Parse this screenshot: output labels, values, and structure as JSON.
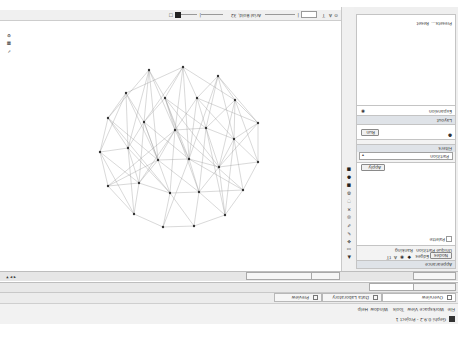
{
  "window": {
    "title": "Gephi 0.9.2 - Project 1"
  },
  "menu": [
    "File",
    "Workspace",
    "View",
    "Tools",
    "Window",
    "Help"
  ],
  "perspectives": [
    {
      "label": "Overview",
      "icon": "overview-icon",
      "active": true
    },
    {
      "label": "Data Laboratory",
      "icon": "table-icon",
      "active": false
    },
    {
      "label": "Preview",
      "icon": "preview-icon",
      "active": false
    }
  ],
  "workspaces": [
    {
      "label": "Workspace 1",
      "close": "×"
    },
    {
      "label": "Workspace 2",
      "close": "×"
    }
  ],
  "doc_tabs": [
    {
      "label": "Appearance",
      "close": "×"
    },
    {
      "label": "Graph",
      "close": "×"
    },
    {
      "label": "Random Graph Project",
      "close": "×"
    }
  ],
  "appearance": {
    "title": "Appearance",
    "targets": [
      "Nodes",
      "Edges"
    ],
    "modes": [
      "Unique",
      "Partition",
      "Ranking"
    ],
    "palette_label": "Palette",
    "apply_label": "Apply"
  },
  "filters": {
    "title": "Queries",
    "run_label": "Run",
    "partition_label": "Partition",
    "section_label": "Filters"
  },
  "layout": {
    "title": "Layout",
    "algorithm": "Expansion",
    "presets_label": "Presets...",
    "reset_label": "Reset"
  },
  "bottom_toolbar": {
    "font": "Arial Bold, 32",
    "font_size_label": "A",
    "zoom_label": "A"
  },
  "graph": {
    "node_color": "#333333",
    "edge_color": "#9a9a9a",
    "nodes": [
      [
        275,
        270
      ],
      [
        240,
        261
      ],
      [
        309,
        267
      ],
      [
        332,
        244
      ],
      [
        293,
        239
      ],
      [
        261,
        239
      ],
      [
        223,
        237
      ],
      [
        350,
        219
      ],
      [
        314,
        215
      ],
      [
        252,
        209
      ],
      [
        283,
        207
      ],
      [
        200,
        214
      ],
      [
        224,
        198
      ],
      [
        330,
        189
      ],
      [
        358,
        185
      ],
      [
        300,
        177
      ],
      [
        269,
        178
      ],
      [
        200,
        175
      ],
      [
        239,
        170
      ],
      [
        319,
        154
      ],
      [
        350,
        151
      ],
      [
        288,
        144
      ],
      [
        259,
        145
      ],
      [
        215,
        147
      ],
      [
        324,
        123
      ],
      [
        233,
        122
      ],
      [
        295,
        110
      ],
      [
        264,
        111
      ]
    ],
    "edges": [
      [
        0,
        3
      ],
      [
        0,
        4
      ],
      [
        0,
        5
      ],
      [
        0,
        6
      ],
      [
        0,
        8
      ],
      [
        0,
        10
      ],
      [
        1,
        5
      ],
      [
        1,
        6
      ],
      [
        1,
        9
      ],
      [
        1,
        12
      ],
      [
        1,
        16
      ],
      [
        2,
        4
      ],
      [
        2,
        8
      ],
      [
        2,
        13
      ],
      [
        2,
        10
      ],
      [
        3,
        7
      ],
      [
        3,
        8
      ],
      [
        3,
        13
      ],
      [
        3,
        15
      ],
      [
        4,
        8
      ],
      [
        4,
        9
      ],
      [
        4,
        10
      ],
      [
        4,
        16
      ],
      [
        4,
        18
      ],
      [
        5,
        9
      ],
      [
        5,
        12
      ],
      [
        5,
        16
      ],
      [
        5,
        19
      ],
      [
        6,
        12
      ],
      [
        6,
        11
      ],
      [
        6,
        9
      ],
      [
        6,
        17
      ],
      [
        7,
        13
      ],
      [
        7,
        14
      ],
      [
        7,
        15
      ],
      [
        7,
        21
      ],
      [
        8,
        13
      ],
      [
        8,
        15
      ],
      [
        8,
        16
      ],
      [
        8,
        19
      ],
      [
        9,
        10
      ],
      [
        9,
        12
      ],
      [
        9,
        18
      ],
      [
        9,
        22
      ],
      [
        10,
        15
      ],
      [
        10,
        16
      ],
      [
        10,
        21
      ],
      [
        10,
        20
      ],
      [
        11,
        17
      ],
      [
        11,
        12
      ],
      [
        11,
        18
      ],
      [
        12,
        17
      ],
      [
        12,
        18
      ],
      [
        12,
        23
      ],
      [
        13,
        14
      ],
      [
        13,
        19
      ],
      [
        13,
        21
      ],
      [
        14,
        20
      ],
      [
        14,
        19
      ],
      [
        15,
        19
      ],
      [
        15,
        16
      ],
      [
        15,
        22
      ],
      [
        16,
        18
      ],
      [
        16,
        22
      ],
      [
        16,
        23
      ],
      [
        17,
        23
      ],
      [
        17,
        18
      ],
      [
        18,
        22
      ],
      [
        18,
        25
      ],
      [
        19,
        20
      ],
      [
        19,
        24
      ],
      [
        19,
        21
      ],
      [
        20,
        24
      ],
      [
        21,
        22
      ],
      [
        21,
        26
      ],
      [
        21,
        27
      ],
      [
        22,
        23
      ],
      [
        22,
        25
      ],
      [
        22,
        27
      ],
      [
        23,
        25
      ],
      [
        24,
        26
      ],
      [
        25,
        27
      ],
      [
        26,
        27
      ],
      [
        3,
        14
      ],
      [
        5,
        11
      ],
      [
        2,
        7
      ],
      [
        8,
        21
      ],
      [
        4,
        22
      ],
      [
        10,
        23
      ],
      [
        15,
        20
      ],
      [
        13,
        24
      ],
      [
        6,
        18
      ],
      [
        1,
        11
      ],
      [
        0,
        16
      ],
      [
        2,
        15
      ],
      [
        14,
        24
      ],
      [
        12,
        25
      ],
      [
        16,
        26
      ],
      [
        9,
        25
      ]
    ]
  }
}
